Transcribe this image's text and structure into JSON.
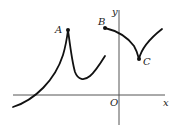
{
  "diagram": {
    "axes": {
      "x_label": "x",
      "y_label": "y",
      "origin_label": "O"
    },
    "points": [
      {
        "id": "A",
        "label": "A",
        "kind": "cusp (local maximum)"
      },
      {
        "id": "B",
        "label": "B",
        "kind": "endpoint (discontinuity)"
      },
      {
        "id": "C",
        "label": "C",
        "kind": "cusp (local minimum)"
      }
    ],
    "colors": {
      "curve": "#111111",
      "axis": "#555555",
      "label": "#222222",
      "background": "#ffffff"
    }
  }
}
